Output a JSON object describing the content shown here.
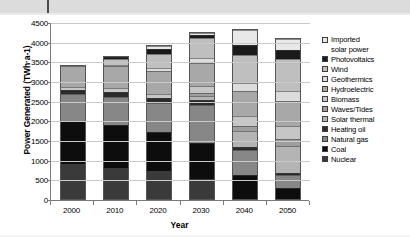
{
  "chart_data": {
    "type": "bar",
    "stacked": true,
    "title": "",
    "xlabel": "Year",
    "ylabel": "Power Generated (TWh·a-1)",
    "categories": [
      "2000",
      "2010",
      "2020",
      "2030",
      "2040",
      "2050"
    ],
    "ylim": [
      0,
      4500
    ],
    "ytick_labels": [
      "0",
      "500",
      "1000",
      "1500",
      "2000",
      "2500",
      "3000",
      "3500",
      "4000",
      "4500"
    ],
    "ytick_values": [
      0,
      500,
      1000,
      1500,
      2000,
      2500,
      3000,
      3500,
      4000,
      4500
    ],
    "ytick_step": 500,
    "grid": true,
    "legend_position": "right",
    "series": [
      {
        "name": "Nuclear",
        "color": "#3a3a3a",
        "values": [
          900,
          800,
          700,
          520,
          0,
          0
        ]
      },
      {
        "name": "Coal",
        "color": "#0d0d0d",
        "values": [
          1080,
          1080,
          1000,
          900,
          620,
          270
        ]
      },
      {
        "name": "Natural gas",
        "color": "#878787",
        "values": [
          680,
          720,
          740,
          980,
          620,
          330
        ]
      },
      {
        "name": "Heating oil",
        "color": "#2b2b2b",
        "values": [
          120,
          130,
          120,
          110,
          80,
          60
        ]
      },
      {
        "name": "Solar thermal",
        "color": "#b4b4b4",
        "values": [
          0,
          0,
          0,
          120,
          420,
          700
        ]
      },
      {
        "name": "Waves/Tides",
        "color": "#9e9e9e",
        "values": [
          0,
          0,
          0,
          60,
          120,
          160
        ]
      },
      {
        "name": "Biomass",
        "color": "#c6c6c6",
        "values": [
          60,
          90,
          120,
          180,
          260,
          340
        ]
      },
      {
        "name": "Hydroelectric",
        "color": "#a8a8a8",
        "values": [
          540,
          560,
          580,
          600,
          620,
          640
        ]
      },
      {
        "name": "Geothermics",
        "color": "#dcdcdc",
        "values": [
          0,
          30,
          60,
          120,
          200,
          260
        ]
      },
      {
        "name": "Wind",
        "color": "#bfbfbf",
        "values": [
          0,
          150,
          360,
          500,
          720,
          800
        ]
      },
      {
        "name": "Photovoltaics",
        "color": "#1a1a1a",
        "values": [
          0,
          50,
          130,
          90,
          260,
          240
        ]
      },
      {
        "name": "Imported solar power",
        "color": "#e8e8e8",
        "values": [
          0,
          0,
          70,
          50,
          370,
          270
        ]
      }
    ],
    "bar_totals": [
      3380,
      3610,
      3880,
      4230,
      4290,
      4070
    ]
  },
  "legend": {
    "items": [
      {
        "label": "Imported\nsolar power",
        "swatch": "#e8e8e8"
      },
      {
        "label": "Photovoltaics",
        "swatch": "#1a1a1a"
      },
      {
        "label": "Wind",
        "swatch": "#bfbfbf"
      },
      {
        "label": "Geothermics",
        "swatch": "#dcdcdc"
      },
      {
        "label": "Hydroelectric",
        "swatch": "#a8a8a8"
      },
      {
        "label": "Biomass",
        "swatch": "#c6c6c6"
      },
      {
        "label": "Waves/Tides",
        "swatch": "#9e9e9e"
      },
      {
        "label": "Solar thermal",
        "swatch": "#b4b4b4"
      },
      {
        "label": "Heating oil",
        "swatch": "#2b2b2b"
      },
      {
        "label": "Natural gas",
        "swatch": "#878787"
      },
      {
        "label": "Coal",
        "swatch": "#0d0d0d"
      },
      {
        "label": "Nuclear",
        "swatch": "#3a3a3a"
      }
    ]
  },
  "page": {
    "top_band_color": "#dcdcdc",
    "axis_color": "#7a7a7a",
    "grid_color": "#c9c9c9"
  }
}
